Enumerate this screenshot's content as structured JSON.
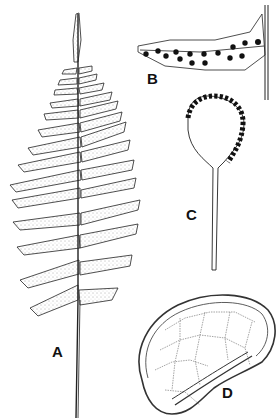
{
  "figure": {
    "panels": [
      {
        "id": "A",
        "label": "A",
        "subject": "fern-frond"
      },
      {
        "id": "B",
        "label": "B",
        "subject": "pinna-with-sori"
      },
      {
        "id": "C",
        "label": "C",
        "subject": "sporangium"
      },
      {
        "id": "D",
        "label": "D",
        "subject": "spore"
      }
    ],
    "colors": {
      "ink": "#111111",
      "background": "#ffffff"
    }
  }
}
